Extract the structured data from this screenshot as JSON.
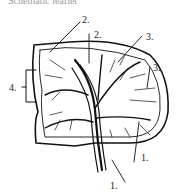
{
  "caption": "Schematic leaflet",
  "labels": {
    "l1_bottom": "1.",
    "l1_right": "1.",
    "l2_left": "2.",
    "l2_right": "2.",
    "l3_top": "3.",
    "l3_right": "3.",
    "l4": "4."
  },
  "colors": {
    "ink": "#111111",
    "background": "#ffffff"
  }
}
